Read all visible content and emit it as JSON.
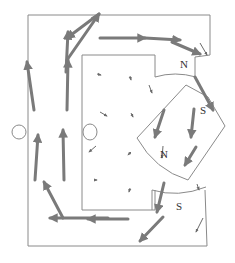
{
  "diagram": {
    "type": "magnetic-field-vector-plot",
    "labels": {
      "stator_north": "N",
      "rotor_south": "S",
      "rotor_north": "N",
      "stator_south": "S"
    },
    "colors": {
      "outline": "#8a8a8a",
      "flux_arrow": "#7a7a7a",
      "small_arrow": "#6a6a6a",
      "label": "#333333",
      "background": "#ffffff"
    },
    "holes": [
      {
        "name": "left-hole",
        "cx": 19,
        "cy": 132
      },
      {
        "name": "inner-hole",
        "cx": 90,
        "cy": 132
      }
    ],
    "big_arrows": [
      {
        "x1": 34,
        "y1": 110,
        "x2": 27,
        "y2": 62
      },
      {
        "x1": 67,
        "y1": 110,
        "x2": 68,
        "y2": 60
      },
      {
        "x1": 66,
        "y1": 72,
        "x2": 68,
        "y2": 32
      },
      {
        "x1": 67,
        "y1": 60,
        "x2": 99,
        "y2": 14
      },
      {
        "x1": 99,
        "y1": 14,
        "x2": 67,
        "y2": 38
      },
      {
        "x1": 64,
        "y1": 180,
        "x2": 63,
        "y2": 130
      },
      {
        "x1": 35,
        "y1": 180,
        "x2": 38,
        "y2": 135
      },
      {
        "x1": 63,
        "y1": 218,
        "x2": 44,
        "y2": 182
      },
      {
        "x1": 108,
        "y1": 218,
        "x2": 50,
        "y2": 218
      },
      {
        "x1": 128,
        "y1": 219,
        "x2": 88,
        "y2": 219
      },
      {
        "x1": 100,
        "y1": 38,
        "x2": 145,
        "y2": 38
      },
      {
        "x1": 145,
        "y1": 38,
        "x2": 180,
        "y2": 40
      },
      {
        "x1": 172,
        "y1": 42,
        "x2": 200,
        "y2": 54
      },
      {
        "x1": 195,
        "y1": 77,
        "x2": 213,
        "y2": 110
      },
      {
        "x1": 164,
        "y1": 110,
        "x2": 155,
        "y2": 137
      },
      {
        "x1": 194,
        "y1": 109,
        "x2": 191,
        "y2": 137
      },
      {
        "x1": 196,
        "y1": 147,
        "x2": 185,
        "y2": 165
      },
      {
        "x1": 164,
        "y1": 183,
        "x2": 157,
        "y2": 212
      },
      {
        "x1": 163,
        "y1": 217,
        "x2": 140,
        "y2": 241
      }
    ],
    "small_arrows": [
      {
        "x1": 97,
        "y1": 74,
        "x2": 101,
        "y2": 75
      },
      {
        "x1": 130,
        "y1": 76,
        "x2": 131,
        "y2": 80
      },
      {
        "x1": 100,
        "y1": 112,
        "x2": 107,
        "y2": 116
      },
      {
        "x1": 131,
        "y1": 113,
        "x2": 133,
        "y2": 117
      },
      {
        "x1": 96,
        "y1": 146,
        "x2": 89,
        "y2": 152
      },
      {
        "x1": 131,
        "y1": 152,
        "x2": 128,
        "y2": 155
      },
      {
        "x1": 95,
        "y1": 180,
        "x2": 97,
        "y2": 180
      },
      {
        "x1": 130,
        "y1": 188,
        "x2": 129,
        "y2": 192
      },
      {
        "x1": 149,
        "y1": 85,
        "x2": 152,
        "y2": 93
      },
      {
        "x1": 200,
        "y1": 43,
        "x2": 207,
        "y2": 55
      },
      {
        "x1": 163,
        "y1": 146,
        "x2": 162,
        "y2": 158
      },
      {
        "x1": 197,
        "y1": 184,
        "x2": 199,
        "y2": 190
      },
      {
        "x1": 203,
        "y1": 218,
        "x2": 196,
        "y2": 232
      }
    ]
  }
}
